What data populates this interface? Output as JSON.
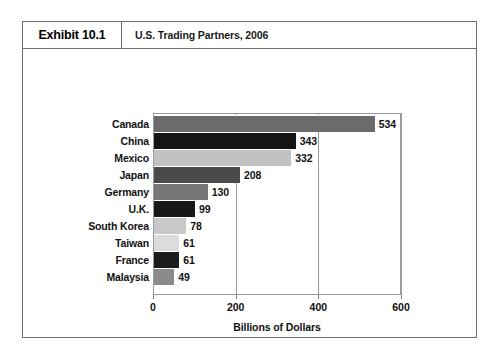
{
  "exhibit": {
    "tag": "Exhibit 10.1",
    "title": "U.S. Trading Partners, 2006"
  },
  "chart_data": {
    "type": "bar",
    "orientation": "horizontal",
    "title": "U.S. Trading Partners, 2006",
    "xlabel": "Billions of Dollars",
    "ylabel": "",
    "xlim": [
      0,
      600
    ],
    "xticks": [
      0,
      200,
      400,
      600
    ],
    "xtick_labels": [
      "0",
      "200",
      "400",
      "600"
    ],
    "grid": true,
    "legend": false,
    "categories": [
      "Canada",
      "China",
      "Mexico",
      "Japan",
      "Germany",
      "U.K.",
      "South Korea",
      "Taiwan",
      "France",
      "Malaysia"
    ],
    "values": [
      534,
      343,
      332,
      208,
      130,
      99,
      78,
      61,
      61,
      49
    ],
    "value_labels": [
      "534",
      "343",
      "332",
      "208",
      "130",
      "99",
      "78",
      "61",
      "61",
      "49"
    ],
    "bar_colors": [
      "#6b6b6b",
      "#141414",
      "#c2c2c2",
      "#4a4a4a",
      "#777777",
      "#181818",
      "#c8c8c8",
      "#dcdcdc",
      "#1c1c1c",
      "#8a8a8a"
    ]
  },
  "colors": {
    "frame_border": "#6e6e6e",
    "axis": "#9a9a9a",
    "text": "#111111",
    "background": "#ffffff"
  }
}
